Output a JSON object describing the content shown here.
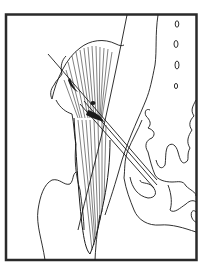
{
  "figure": {
    "caption": "",
    "colors": {
      "background": "#ffffff",
      "line": "#1a1a1a",
      "frame": "#2a2a2a"
    },
    "elements": [
      {
        "name": "frame",
        "label": ""
      },
      {
        "name": "femur",
        "label": ""
      },
      {
        "name": "muscle",
        "label": ""
      },
      {
        "name": "needle",
        "label": ""
      },
      {
        "name": "pelvis",
        "label": ""
      },
      {
        "name": "vertebrae",
        "label": ""
      }
    ]
  }
}
